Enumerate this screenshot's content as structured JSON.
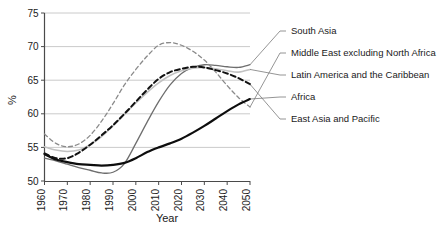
{
  "chart_data": {
    "type": "line",
    "title": "",
    "xlabel": "Year",
    "ylabel": "%",
    "xlim": [
      1960,
      2050
    ],
    "ylim": [
      50,
      75
    ],
    "xticks": [
      "1960",
      "1970",
      "1980",
      "1990",
      "2000",
      "2010",
      "2020",
      "2030",
      "2040",
      "2050"
    ],
    "yticks": [
      "50",
      "55",
      "60",
      "65",
      "70",
      "75"
    ],
    "grid": "horizontal",
    "legend_position": "right-inline-labels",
    "x": [
      1960,
      1965,
      1970,
      1975,
      1980,
      1985,
      1990,
      1995,
      2000,
      2005,
      2010,
      2015,
      2020,
      2025,
      2030,
      2035,
      2040,
      2045,
      2050
    ],
    "series": [
      {
        "name": "South Asia",
        "style": "solid",
        "color": "#6e6e6e",
        "width": 1.3,
        "values": [
          53.4,
          53.0,
          52.5,
          52.0,
          51.6,
          51.2,
          51.3,
          52.6,
          55.6,
          58.8,
          61.8,
          64.3,
          66.0,
          66.9,
          67.3,
          67.2,
          67.0,
          66.9,
          67.3
        ]
      },
      {
        "name": "Middle East excluding North Africa",
        "style": "dashed",
        "color": "#8a8a8a",
        "width": 1.3,
        "values": [
          57.0,
          55.6,
          55.1,
          55.5,
          56.8,
          58.9,
          61.5,
          64.3,
          66.6,
          68.6,
          70.2,
          70.6,
          70.2,
          69.3,
          68.0,
          66.2,
          64.2,
          62.4,
          61.0
        ]
      },
      {
        "name": "Latin America and the Caribbean",
        "style": "solid",
        "color": "#c2c2c2",
        "width": 1.6,
        "values": [
          55.1,
          54.6,
          54.4,
          54.6,
          55.4,
          56.6,
          58.2,
          59.9,
          61.6,
          63.2,
          64.6,
          65.7,
          66.4,
          66.8,
          66.9,
          66.7,
          66.4,
          66.2,
          66.6
        ]
      },
      {
        "name": "Africa",
        "style": "solid",
        "color": "#0d0d0d",
        "width": 2.2,
        "values": [
          54.0,
          53.2,
          52.8,
          52.5,
          52.4,
          52.3,
          52.4,
          52.7,
          53.4,
          54.3,
          55.0,
          55.6,
          56.3,
          57.2,
          58.2,
          59.3,
          60.4,
          61.4,
          62.2
        ]
      },
      {
        "name": "East Asia and Pacific",
        "style": "dashed",
        "color": "#111111",
        "width": 2.0,
        "values": [
          54.1,
          53.4,
          53.4,
          54.2,
          55.4,
          56.8,
          58.3,
          60.0,
          61.8,
          63.6,
          65.2,
          66.2,
          66.7,
          67.0,
          66.9,
          66.5,
          66.0,
          65.3,
          64.4
        ]
      }
    ],
    "annotations": [
      {
        "label": "South Asia",
        "x_px": 291,
        "y_px": 34
      },
      {
        "label": "Middle East excluding North Africa",
        "x_px": 291,
        "y_px": 56
      },
      {
        "label": "Latin America and the Caribbean",
        "x_px": 291,
        "y_px": 78
      },
      {
        "label": "Africa",
        "x_px": 291,
        "y_px": 100
      },
      {
        "label": "East Asia and Pacific",
        "x_px": 291,
        "y_px": 122
      }
    ]
  }
}
